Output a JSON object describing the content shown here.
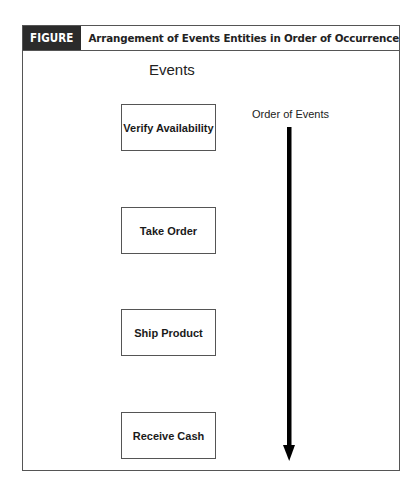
{
  "figure": {
    "number_label": "FIGURE 10-5",
    "title": "Arrangement of Events Entities in Order of Occurrence"
  },
  "diagram": {
    "column_label": "Events",
    "order_label": "Order of Events",
    "arrow_direction": "down",
    "events": [
      {
        "label": "Verify Availability"
      },
      {
        "label": "Take Order"
      },
      {
        "label": "Ship Product"
      },
      {
        "label": "Receive Cash"
      }
    ]
  },
  "colors": {
    "header_dark": "#2b2b2b",
    "border": "#555555",
    "text": "#222222",
    "arrow": "#000000"
  }
}
